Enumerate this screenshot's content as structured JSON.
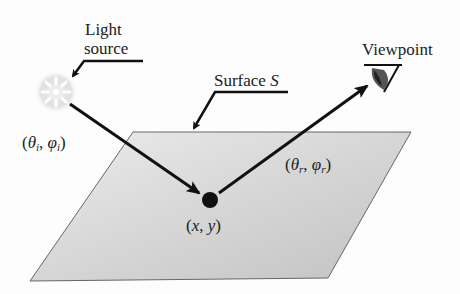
{
  "diagram": {
    "light_source_label_line1": "Light",
    "light_source_label_line2": "source",
    "surface_label_prefix": "Surface ",
    "surface_label_symbol": "S",
    "viewpoint_label": "Viewpoint",
    "incident_angles": {
      "open": "(",
      "theta": "θ",
      "theta_sub": "i",
      "sep": ", ",
      "phi": "φ",
      "phi_sub": "i",
      "close": ")"
    },
    "reflected_angles": {
      "open": "(",
      "theta": "θ",
      "theta_sub": "r",
      "sep": ", ",
      "phi": "φ",
      "phi_sub": "r",
      "close": ")"
    },
    "point_label": {
      "open": "(",
      "x": "x",
      "sep": ", ",
      "y": "y",
      "close": ")"
    }
  },
  "colors": {
    "surface_fill_light": "#e6e6e6",
    "surface_fill_dark": "#b8b8b8",
    "surface_stroke": "#666666",
    "arrow": "#111111"
  }
}
